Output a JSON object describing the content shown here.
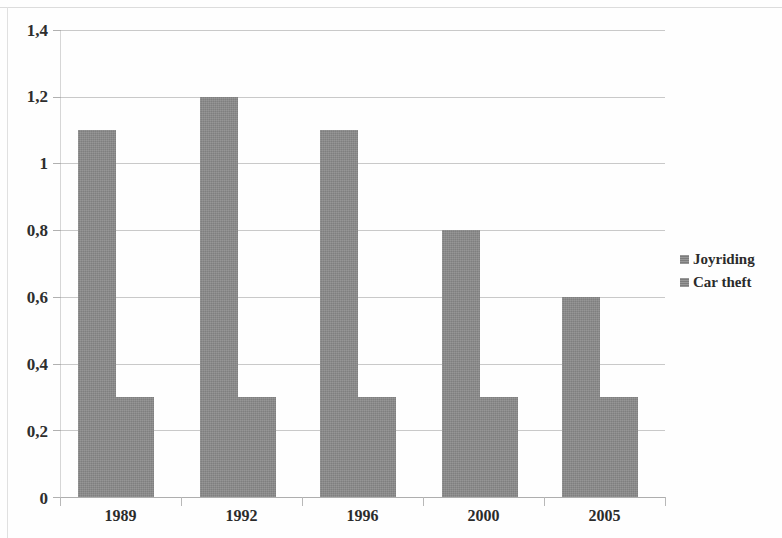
{
  "chart_data": {
    "type": "bar",
    "title": "",
    "subtitle": "",
    "xlabel": "",
    "ylabel": "",
    "categories": [
      "1989",
      "1992",
      "1996",
      "2000",
      "2005"
    ],
    "series": [
      {
        "name": "Joyriding",
        "color": "#8a8a8a",
        "values": [
          1.1,
          1.2,
          1.1,
          0.8,
          0.6
        ]
      },
      {
        "name": "Car theft",
        "color": "#8a8a8a",
        "values": [
          0.3,
          0.3,
          0.3,
          0.3,
          0.3
        ]
      }
    ],
    "ylim": [
      0,
      1.4
    ],
    "y_ticks": [
      0,
      0.2,
      0.4,
      0.6,
      0.8,
      1.0,
      1.2,
      1.4
    ],
    "y_tick_labels": [
      "0",
      "0,2",
      "0,4",
      "0,6",
      "0,8",
      "1",
      "1,2",
      "1,4"
    ],
    "decimal_separator": ",",
    "grid": true,
    "grid_axis": "y",
    "legend_position": "right",
    "bar_gap_within_group": 0
  },
  "legend": {
    "items": [
      {
        "label": "Joyriding",
        "swatch_name": "legend-swatch-joyriding"
      },
      {
        "label": "Car theft",
        "swatch_name": "legend-swatch-car-theft"
      }
    ]
  },
  "axes": {
    "y_labels": [
      "1,4",
      "1,2",
      "1",
      "0,8",
      "0,6",
      "0,4",
      "0,2",
      "0"
    ],
    "x_labels": [
      "1989",
      "1992",
      "1996",
      "2000",
      "2005"
    ]
  },
  "colors": {
    "bar": "#8a8a8a",
    "grid": "#c9c9c9",
    "axis": "#aeaeae",
    "text": "#2b2b2b",
    "background": "#fefefe"
  }
}
